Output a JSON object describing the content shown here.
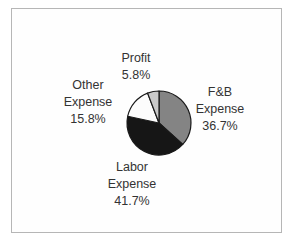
{
  "chart_data": {
    "type": "pie",
    "title": "",
    "direction": "clockwise",
    "start_angle_deg": 0,
    "outline_color": "#1a1a1a",
    "slices": [
      {
        "label": "F&B Expense",
        "value": 36.7,
        "color": "#848484",
        "label_lines": [
          "F&B",
          "Expense",
          "36.7%"
        ]
      },
      {
        "label": "Labor Expense",
        "value": 41.7,
        "color": "#161616",
        "label_lines": [
          "Labor",
          "Expense",
          "41.7%"
        ]
      },
      {
        "label": "Other Expense",
        "value": 15.8,
        "color": "#fcfcfc",
        "label_lines": [
          "Other",
          "Expense",
          "15.8%"
        ]
      },
      {
        "label": "Profit",
        "value": 5.8,
        "color": "#c9c9c9",
        "label_lines": [
          "Profit",
          "5.8%"
        ]
      }
    ]
  }
}
